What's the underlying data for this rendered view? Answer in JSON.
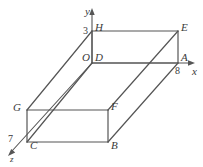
{
  "figure": {
    "type": "geometry-diagram",
    "background_color": "#ffffff",
    "stroke_color": "#555555",
    "text_color": "#3a3a3a",
    "axes": [
      {
        "name": "y-axis",
        "label": "y",
        "label_x": 85,
        "label_y": 6,
        "direction": "up"
      },
      {
        "name": "x-axis",
        "label": "x",
        "label_x": 192,
        "label_y": 66,
        "direction": "right"
      },
      {
        "name": "z-axis",
        "label": "z",
        "label_x": 10,
        "label_y": 155,
        "direction": "down-left"
      }
    ],
    "tick_labels": [
      {
        "name": "tick-y-3",
        "text": "3",
        "x": 83,
        "y": 26
      },
      {
        "name": "tick-x-8",
        "text": "8",
        "x": 175,
        "y": 66
      },
      {
        "name": "tick-z-7",
        "text": "7",
        "x": 8,
        "y": 134
      }
    ],
    "vertices": [
      {
        "name": "origin",
        "label": "O",
        "x": 82,
        "y": 52,
        "italic": true
      },
      {
        "name": "vertex-H",
        "label": "H",
        "x": 95,
        "y": 22,
        "italic": true
      },
      {
        "name": "vertex-E",
        "label": "E",
        "x": 181,
        "y": 22,
        "italic": true
      },
      {
        "name": "vertex-D",
        "label": "D",
        "x": 95,
        "y": 52,
        "italic": true
      },
      {
        "name": "vertex-A",
        "label": "A",
        "x": 181,
        "y": 52,
        "italic": true
      },
      {
        "name": "vertex-G",
        "label": "G",
        "x": 13,
        "y": 102,
        "italic": true
      },
      {
        "name": "vertex-F",
        "label": "F",
        "x": 111,
        "y": 101,
        "italic": true
      },
      {
        "name": "vertex-C",
        "label": "C",
        "x": 30,
        "y": 140,
        "italic": true
      },
      {
        "name": "vertex-B",
        "label": "B",
        "x": 111,
        "y": 140,
        "italic": true
      }
    ],
    "geometry": {
      "top_face": {
        "H": [
          92,
          31
        ],
        "E": [
          178,
          31
        ],
        "A": [
          178,
          63
        ],
        "D": [
          92,
          63
        ]
      },
      "front_face": {
        "G": [
          27,
          110
        ],
        "F": [
          108,
          110
        ],
        "B": [
          108,
          142
        ],
        "C": [
          27,
          142
        ]
      },
      "connectors": [
        {
          "from": "G",
          "to": "H"
        },
        {
          "from": "C",
          "to": "D"
        },
        {
          "from": "F",
          "to": "E"
        },
        {
          "from": "B",
          "to": "A"
        }
      ]
    }
  }
}
